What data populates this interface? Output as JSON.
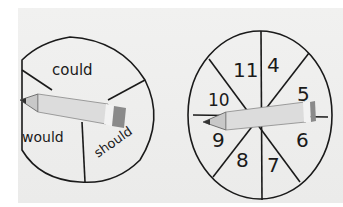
{
  "left_spinner": {
    "sections": [
      "could",
      "should",
      "would"
    ]
  },
  "right_spinner": {
    "sections": [
      "4",
      "5",
      "6",
      "7",
      "8",
      "9",
      "10",
      "11"
    ]
  },
  "colors": {
    "paper": "#eeeeed",
    "ink": "#1a1a1a",
    "pencil_body": "#d9d9d9",
    "pencil_eraser": "#8a8a8a"
  }
}
